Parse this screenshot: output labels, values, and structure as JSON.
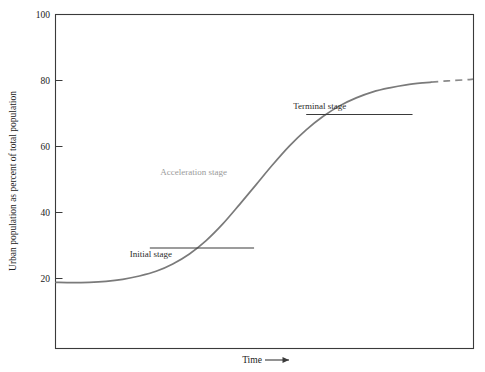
{
  "chart_data": {
    "type": "line",
    "title": "",
    "subtitle": "",
    "xlabel": "Time",
    "xlabel_suffix": "⟶",
    "ylabel": "Urban population as percent of total population",
    "xlim": [
      0,
      100
    ],
    "ylim": [
      0,
      100
    ],
    "grid": false,
    "legend_position": "none",
    "y_ticks": [
      20,
      40,
      60,
      80,
      100
    ],
    "y_tick_labels": [
      "20",
      "40",
      "60",
      "80",
      "100"
    ],
    "x_ticks": [],
    "x_tick_labels": [],
    "series": [
      {
        "name": "Urbanization S-curve",
        "style": "solid",
        "color": "#7a7a7a",
        "x": [
          0,
          4,
          8,
          12,
          16,
          20,
          24,
          28,
          32,
          36,
          40,
          44,
          48,
          52,
          56,
          60,
          64,
          68,
          72,
          76,
          80,
          84,
          88,
          90
        ],
        "y": [
          19.7,
          19.6,
          19.7,
          20.0,
          20.6,
          21.6,
          23.0,
          25.2,
          28.2,
          32.2,
          37.2,
          43.0,
          49.0,
          55.0,
          60.6,
          65.4,
          69.4,
          72.6,
          75.0,
          76.8,
          78.0,
          78.9,
          79.5,
          79.7
        ]
      },
      {
        "name": "Projected continuation",
        "style": "dashed",
        "color": "#8a8a8a",
        "x": [
          90,
          94,
          98,
          100
        ],
        "y": [
          79.7,
          80.1,
          80.4,
          80.6
        ]
      }
    ],
    "annotations": [
      {
        "id": "initial-stage",
        "label": "Initial stage",
        "text_color": "#2b2b2b",
        "rule": true,
        "rule_x_start": 22.5,
        "rule_x_end": 47.5,
        "rule_y": 30,
        "label_anchor": "below-left"
      },
      {
        "id": "acceleration-stage",
        "label": "Acceleration stage",
        "text_color": "#9a9a9a",
        "rule": false,
        "label_x": 33,
        "label_y": 52,
        "label_anchor": "middle"
      },
      {
        "id": "terminal-stage",
        "label": "Terminal stage",
        "text_color": "#2b2b2b",
        "rule": true,
        "rule_x_start": 60,
        "rule_x_end": 85.5,
        "rule_y": 70,
        "label_anchor": "above-left"
      }
    ]
  },
  "figure": {
    "background": "#ffffff",
    "frame_color": "#3a3a3a",
    "curve_color": "#7a7a7a",
    "rule_color": "#3a3a3a"
  }
}
